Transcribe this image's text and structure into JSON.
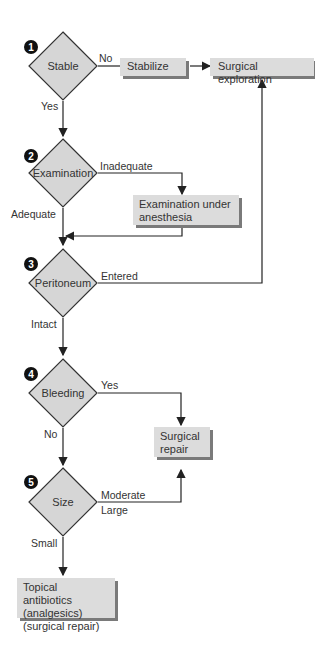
{
  "nodes": {
    "stable": {
      "step": "1",
      "label": "Stable"
    },
    "examination": {
      "step": "2",
      "label": "Examination"
    },
    "peritoneum": {
      "step": "3",
      "label": "Peritoneum"
    },
    "bleeding": {
      "step": "4",
      "label": "Bleeding"
    },
    "size": {
      "step": "5",
      "label": "Size"
    },
    "stabilize": {
      "label": "Stabilize"
    },
    "surgical_exploration": {
      "label": "Surgical exploration"
    },
    "exam_anesthesia": {
      "line1": "Examination under",
      "line2": "anesthesia"
    },
    "surgical_repair": {
      "line1": "Surgical",
      "line2": "repair"
    },
    "topical": {
      "line1": "Topical antibiotics",
      "line2": "(analgesics)",
      "line3": "(surgical repair)"
    }
  },
  "edges": {
    "stable_no": "No",
    "stable_yes": "Yes",
    "exam_inadequate": "Inadequate",
    "exam_adequate": "Adequate",
    "peritoneum_entered": "Entered",
    "peritoneum_intact": "Intact",
    "bleeding_yes": "Yes",
    "bleeding_no": "No",
    "size_moderate": "Moderate",
    "size_large": "Large",
    "size_small": "Small"
  },
  "colors": {
    "node_fill": "#d6d6d6",
    "box_fill": "#dcdcdc",
    "shadow": "#7a7a7a",
    "line": "#222222"
  }
}
